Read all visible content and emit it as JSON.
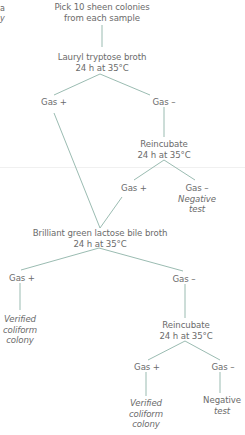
{
  "edge_fragment": [
    "a",
    "y"
  ],
  "line_color": "#8fb3a8",
  "nodes": {
    "start": [
      "Pick 10 sheen colonies",
      "from each sample"
    ],
    "lauryl": [
      "Lauryl tryptose broth",
      "24 h at 35°C"
    ],
    "l_gas_pos": "Gas +",
    "l_gas_neg": "Gas –",
    "reinc1": [
      "Reincubate",
      "24 h at 35°C"
    ],
    "r1_gas_pos": "Gas +",
    "r1_gas_neg": "Gas –",
    "r1_negative": [
      "Negative",
      "test"
    ],
    "brilliant": [
      "Brilliant green lactose bile broth",
      "24 h at 35°C"
    ],
    "b_gas_pos": "Gas +",
    "b_gas_neg": "Gas –",
    "b_verified": [
      "Verified",
      "coliform",
      "colony"
    ],
    "reinc2": [
      "Reincubate",
      "24 h at 35°C"
    ],
    "r2_gas_pos": "Gas +",
    "r2_gas_neg": "Gas –",
    "r2_verified": [
      "Verified",
      "coliform",
      "colony"
    ],
    "r2_negative": [
      "Negative",
      "test"
    ]
  }
}
